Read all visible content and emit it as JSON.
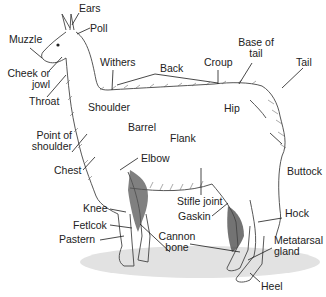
{
  "diagram": {
    "colors": {
      "text": "#222222",
      "line": "#1a1a1a",
      "body_outline": "#444444",
      "shadow": "#d9d9d9",
      "dark_fur": "#3a3a3a"
    },
    "labels": {
      "ears": "Ears",
      "poll": "Poll",
      "muzzle": "Muzzle",
      "cheek": "Cheek or\njowl",
      "throat": "Throat",
      "withers": "Withers",
      "back": "Back",
      "croup": "Croup",
      "base_of_tail": "Base of\ntail",
      "tail": "Tail",
      "shoulder": "Shoulder",
      "hip": "Hip",
      "barrel": "Barrel",
      "flank": "Flank",
      "point_of_shoulder": "Point of\nshoulder",
      "elbow": "Elbow",
      "chest": "Chest",
      "buttock": "Buttock",
      "stifle_joint": "Stifle joint",
      "gaskin": "Gaskin",
      "knee": "Knee",
      "hock": "Hock",
      "fetlock": "Fetlcok",
      "cannon_bone": "Cannon\nbone",
      "metatarsal_gland": "Metatarsal\ngland",
      "pastern": "Pastern",
      "heel": "Heel"
    }
  }
}
